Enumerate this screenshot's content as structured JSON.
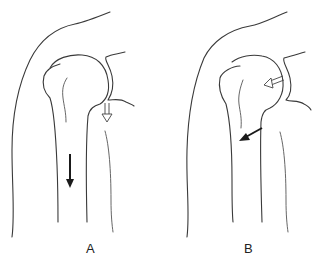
{
  "figure": {
    "panels": [
      {
        "id": "A",
        "label": "A",
        "arrows": [
          {
            "kind": "solid",
            "direction": "down",
            "description": "humeral shaft arrow"
          },
          {
            "kind": "hollow",
            "direction": "down",
            "description": "glenoid-side arrow"
          }
        ]
      },
      {
        "id": "B",
        "label": "B",
        "arrows": [
          {
            "kind": "solid",
            "direction": "down-left",
            "description": "humeral neck arrow"
          },
          {
            "kind": "hollow",
            "direction": "left",
            "description": "humeral head arrow"
          }
        ]
      }
    ],
    "colors": {
      "line": "#3a3a3a",
      "background": "#ffffff",
      "arrow_solid": "#1a1a1a"
    }
  }
}
